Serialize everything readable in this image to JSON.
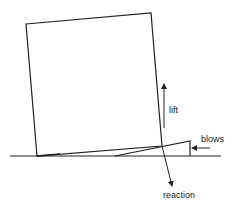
{
  "diagram": {
    "type": "mechanics-free-body",
    "colors": {
      "stroke": "#222222",
      "background": "#ffffff",
      "text": "#222222"
    },
    "labels": {
      "lift": "lift",
      "blows": "blows",
      "reaction": "reaction"
    },
    "elements": [
      {
        "id": "ground-line",
        "kind": "line"
      },
      {
        "id": "block",
        "kind": "tilted-rectangle"
      },
      {
        "id": "wedge",
        "kind": "triangle"
      },
      {
        "id": "lift-arrow",
        "kind": "arrow",
        "direction": "up"
      },
      {
        "id": "blows-arrow",
        "kind": "arrow",
        "direction": "left"
      },
      {
        "id": "reaction-arrow",
        "kind": "arrow",
        "direction": "down"
      }
    ]
  }
}
